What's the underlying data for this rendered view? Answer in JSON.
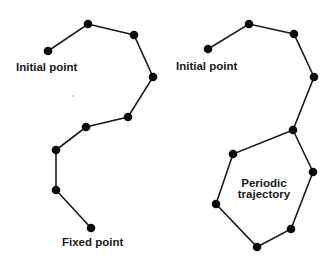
{
  "diagram": {
    "title": "",
    "panels": [
      {
        "name": "fixed-point-trajectory",
        "labels": {
          "start": "Initial point",
          "end": "Fixed point"
        },
        "points": [
          [
            48,
            51
          ],
          [
            88,
            24
          ],
          [
            134,
            35
          ],
          [
            153,
            77
          ],
          [
            128,
            117
          ],
          [
            86,
            127
          ],
          [
            56,
            150
          ],
          [
            56,
            190
          ],
          [
            91,
            228
          ]
        ]
      },
      {
        "name": "periodic-trajectory",
        "labels": {
          "start": "Initial point",
          "cycle_line1": "Periodic",
          "cycle_line2": "trajectory"
        },
        "points": [
          [
            208,
            49
          ],
          [
            249,
            24
          ],
          [
            294,
            34
          ],
          [
            314,
            77
          ],
          [
            293,
            130
          ]
        ],
        "cycle": [
          [
            293,
            130
          ],
          [
            313,
            172
          ],
          [
            291,
            229
          ],
          [
            257,
            247
          ],
          [
            216,
            204
          ],
          [
            233,
            154
          ]
        ]
      }
    ],
    "colors": {
      "node": "#0a0a0a",
      "edge": "#1a1a1a",
      "text": "#1a1a1a",
      "background": "#ffffff"
    }
  }
}
